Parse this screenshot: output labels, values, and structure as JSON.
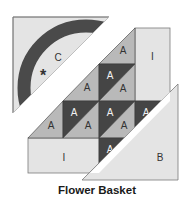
{
  "title": "Flower Basket",
  "colors": {
    "light_fill": "#e4e4e4",
    "medium_fill": "#b9b9b9",
    "dark_fill": "#454545",
    "outline": "#7a7a7a",
    "background": "#ffffff"
  },
  "pieces": {
    "corner_c": {
      "label": "C",
      "star": "*"
    },
    "corner_b": {
      "label": "B"
    },
    "rect_top_right": {
      "label": "I"
    },
    "rect_bottom_left": {
      "label": "I"
    },
    "triangles": [
      {
        "label": "A",
        "row": 0,
        "col": 2,
        "shade": "medium"
      },
      {
        "label": "A",
        "row": 1,
        "col": 1,
        "shade": "medium"
      },
      {
        "label": "A",
        "row": 1,
        "col": 2,
        "shade": "dark"
      },
      {
        "label": "A",
        "row": 1,
        "col": 2,
        "shade": "medium"
      },
      {
        "label": "A",
        "row": 2,
        "col": 0,
        "shade": "medium"
      },
      {
        "label": "A",
        "row": 2,
        "col": 1,
        "shade": "dark"
      },
      {
        "label": "A",
        "row": 2,
        "col": 1,
        "shade": "medium"
      },
      {
        "label": "A",
        "row": 2,
        "col": 2,
        "shade": "dark"
      },
      {
        "label": "A",
        "row": 2,
        "col": 2,
        "shade": "medium"
      },
      {
        "label": "A",
        "row": 2,
        "col": 3,
        "shade": "dark"
      },
      {
        "label": "A",
        "row": 3,
        "col": 2,
        "shade": "dark"
      }
    ]
  }
}
